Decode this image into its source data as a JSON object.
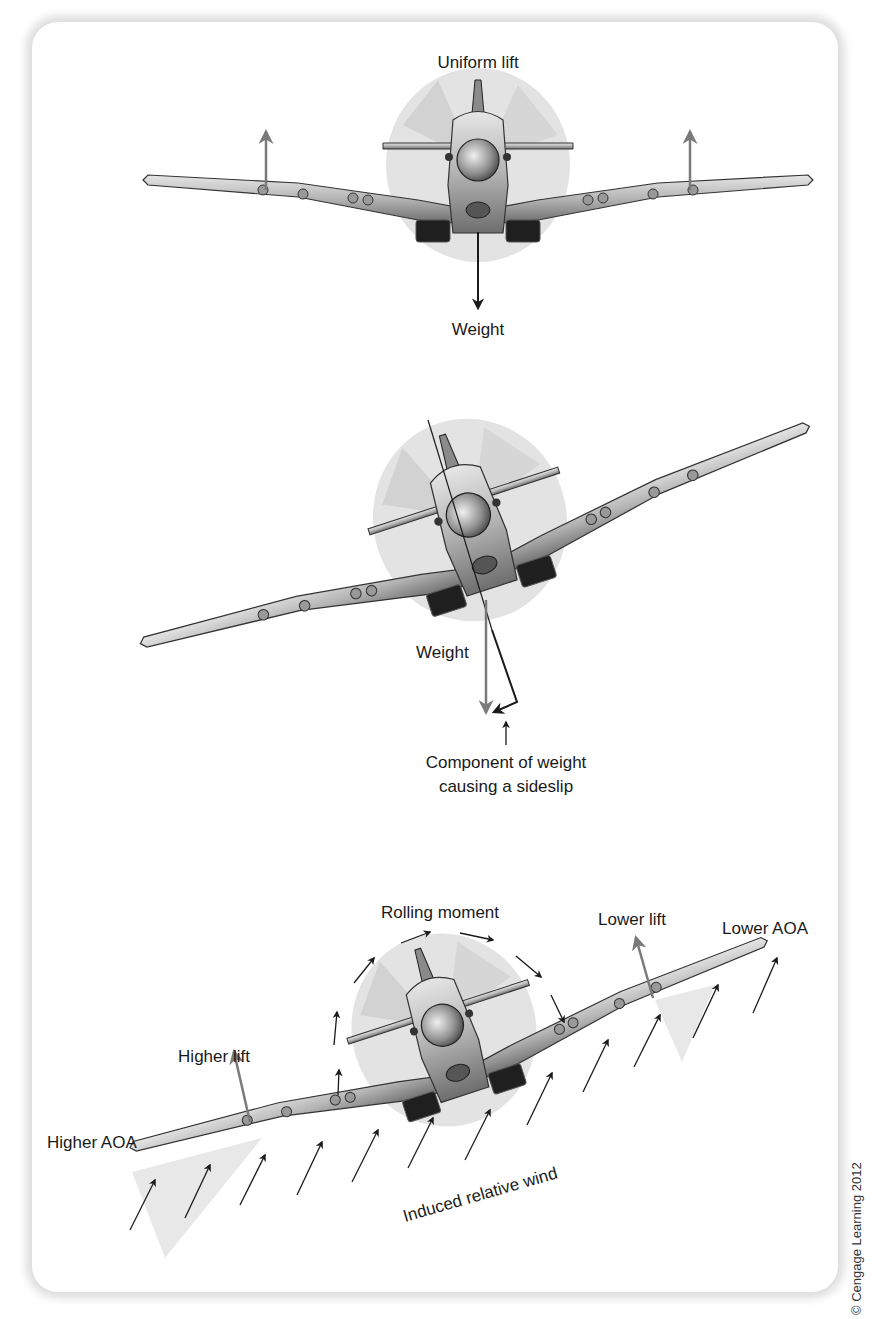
{
  "figure": {
    "panels": [
      {
        "id": "level-flight",
        "labels": {
          "top": "Uniform lift",
          "bottom": "Weight"
        },
        "forces": [
          "lift-left",
          "lift-right",
          "weight"
        ]
      },
      {
        "id": "banked-sideslip",
        "labels": {
          "weight": "Weight",
          "component_line1": "Component of weight",
          "component_line2": "causing a sideslip"
        }
      },
      {
        "id": "dihedral-rolling-moment",
        "labels": {
          "rolling_moment": "Rolling moment",
          "lower_lift": "Lower lift",
          "lower_aoa": "Lower AOA",
          "higher_lift": "Higher lift",
          "higher_aoa": "Higher AOA",
          "induced_wind": "Induced relative wind"
        }
      }
    ],
    "copyright": "© Cengage Learning 2012",
    "colors": {
      "lift_arrow": "#7a7a7a",
      "weight_arrow": "#222222",
      "prop_disc": "#e2e2e2",
      "aoa_wedge": "#e8e8e8",
      "wing": "#a9a9a9"
    }
  }
}
